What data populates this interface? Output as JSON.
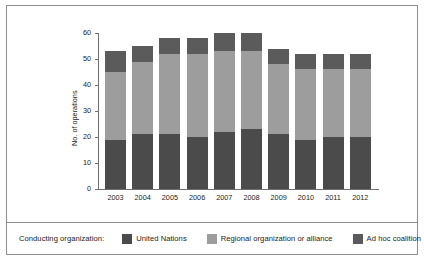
{
  "chart_data": {
    "type": "bar",
    "subtype": "stacked-vertical",
    "title": "",
    "xlabel": "",
    "ylabel": "No. of operations",
    "ylim": [
      0,
      60
    ],
    "yticks": [
      0,
      10,
      20,
      30,
      40,
      50,
      60
    ],
    "ytick_labels": [
      "0",
      "10",
      "20",
      "30",
      "40",
      "50",
      "60"
    ],
    "grid": false,
    "legend_position": "bottom",
    "categories": [
      "2003",
      "2004",
      "2005",
      "2006",
      "2007",
      "2008",
      "2009",
      "2010",
      "2011",
      "2012"
    ],
    "series": [
      {
        "name": "United Nations",
        "color": "#4b4b4b",
        "values": [
          19,
          21,
          21,
          20,
          22,
          23,
          21,
          19,
          20,
          20
        ]
      },
      {
        "name": "Regional organization or alliance",
        "color": "#9d9d9d",
        "values": [
          26,
          28,
          31,
          32,
          31,
          30,
          27,
          27,
          26,
          26
        ]
      },
      {
        "name": "Ad hoc coalition",
        "color": "#5b5b5b",
        "values": [
          8,
          6,
          6,
          6,
          7,
          7,
          6,
          6,
          6,
          6
        ]
      }
    ],
    "totals": [
      53,
      55,
      58,
      58,
      60,
      60,
      54,
      52,
      52,
      52
    ]
  },
  "legend": {
    "title": "Conducting organization:",
    "entries": [
      {
        "label": "United Nations",
        "color": "#4b4b4b"
      },
      {
        "label": "Regional organization or alliance",
        "color": "#9d9d9d"
      },
      {
        "label": "Ad hoc coalition",
        "color": "#5b5b5b"
      }
    ]
  }
}
